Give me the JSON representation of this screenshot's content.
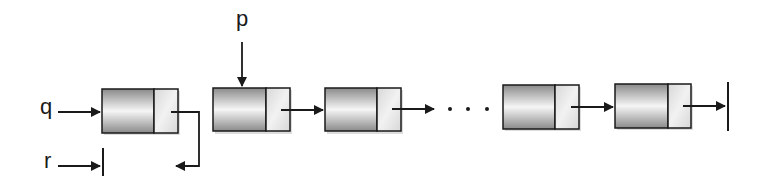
{
  "diagram": {
    "type": "linked-list",
    "pointers": [
      {
        "label": "q",
        "target": "node-1"
      },
      {
        "label": "p",
        "target": "node-2"
      },
      {
        "label": "r",
        "target": "null"
      }
    ],
    "nodes": [
      {
        "id": "node-1",
        "next": "r-null-routed"
      },
      {
        "id": "node-2",
        "next": "node-3"
      },
      {
        "id": "node-3",
        "next": "ellipsis"
      },
      {
        "id": "node-n-1",
        "next": "node-n"
      },
      {
        "id": "node-n",
        "next": "null"
      }
    ],
    "ellipsis": ". . .",
    "colors": {
      "stroke": "#1a1a1a",
      "data_dark": "#8c8c8c",
      "data_light": "#f4f4f4",
      "link_fill": "#e6e6e6"
    }
  }
}
